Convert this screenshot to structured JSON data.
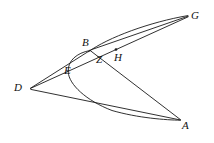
{
  "figure": {
    "background_color": "#ffffff",
    "stroke_color": "#1a1a1a",
    "width": 214,
    "height": 143,
    "labels": [
      {
        "id": "G",
        "text": "G",
        "x": 191,
        "y": 10
      },
      {
        "id": "B",
        "text": "B",
        "x": 82,
        "y": 38
      },
      {
        "id": "H",
        "text": "H",
        "x": 114,
        "y": 52
      },
      {
        "id": "Z",
        "text": "Z",
        "x": 96,
        "y": 54
      },
      {
        "id": "E",
        "text": "E",
        "x": 65,
        "y": 66
      },
      {
        "id": "D",
        "text": "D",
        "x": 14,
        "y": 82
      },
      {
        "id": "A",
        "text": "A",
        "x": 182,
        "y": 121
      }
    ],
    "vertices": {
      "D": {
        "x": 30,
        "y": 88
      },
      "G": {
        "x": 188,
        "y": 16
      },
      "A": {
        "x": 180,
        "y": 120
      },
      "B": {
        "x": 90,
        "y": 50
      },
      "Z": {
        "x": 96,
        "y": 52
      },
      "H": {
        "x": 116,
        "y": 50
      },
      "E": {
        "x": 73,
        "y": 65
      }
    },
    "segments": [
      {
        "id": "D-B-G",
        "from": "D",
        "to": "G",
        "kind": "line"
      },
      {
        "id": "D-E-Z-H-G",
        "from": "D",
        "to": "G",
        "kind": "line"
      },
      {
        "id": "D-A",
        "from": "D",
        "to": "A",
        "kind": "line"
      },
      {
        "id": "B-Z-A",
        "from": "B",
        "to": "A",
        "kind": "line"
      }
    ],
    "arcs": [
      {
        "id": "arc-B-G",
        "from": "B",
        "to": "G",
        "kind": "curve"
      },
      {
        "id": "arc-B-E-A",
        "from": "B",
        "to": "A",
        "kind": "curve"
      }
    ],
    "dots": [
      {
        "id": "H-dot",
        "x": 116,
        "y": 49.5,
        "r": 1.3
      }
    ]
  }
}
